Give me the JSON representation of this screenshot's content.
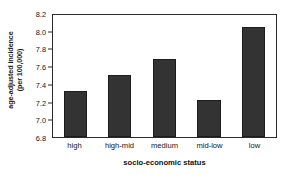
{
  "chart_data": {
    "type": "bar",
    "title": "",
    "subtitle": "",
    "xlabel": "socio-economic status",
    "ylabel_line1": "age-adjusted incidence",
    "ylabel_line2": "(per 100,000)",
    "categories": [
      "high",
      "high-mid",
      "medium",
      "mid-low",
      "low"
    ],
    "values": [
      7.33,
      7.51,
      7.7,
      7.22,
      8.06
    ],
    "series": [
      {
        "name": "age-adjusted incidence (per 100,000)",
        "values": [
          7.33,
          7.51,
          7.7,
          7.22,
          8.06
        ]
      }
    ],
    "ylim": [
      6.8,
      8.2
    ],
    "ytick_values": [
      6.8,
      7.0,
      7.2,
      7.4,
      7.6,
      7.8,
      8.0,
      8.2
    ],
    "ytick_labels": [
      "6.8",
      "7.0",
      "7.2",
      "7.4",
      "7.6",
      "7.8",
      "8.0",
      "8.2"
    ],
    "grid": false,
    "legend": null,
    "legend_position": "none",
    "bar_color": "#333333",
    "axis_color": "#2b2b2b",
    "background_color": "#ffffff"
  }
}
